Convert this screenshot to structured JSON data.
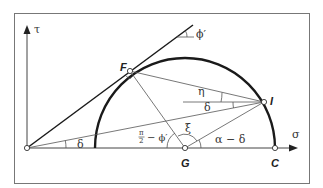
{
  "diagram": {
    "axes": {
      "vertical_label": "τ",
      "horizontal_label": "σ"
    },
    "points": {
      "F": "F",
      "I": "I",
      "G": "G",
      "C": "C"
    },
    "angles": {
      "phi_prime": "ϕ′",
      "eta": "η",
      "delta_at_I": "δ",
      "delta_at_origin": "δ",
      "pi_over_2_numerator": "π",
      "pi_over_2_denominator": "2",
      "pi_over_2_minus_phi": "− ϕ′",
      "xi": "ξ",
      "alpha_minus_delta": "α − δ"
    },
    "colors": {
      "line": "#222222",
      "thin_line": "#555555",
      "frame": "#777777"
    }
  }
}
